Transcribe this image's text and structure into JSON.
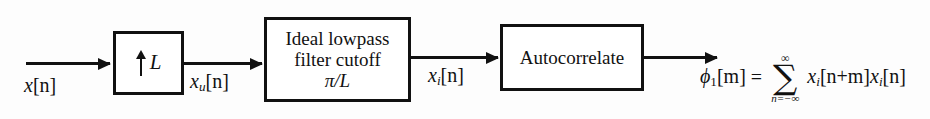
{
  "diagram": {
    "type": "signal-processing-block-diagram",
    "background_color": "#fdfdfd",
    "line_color": "#111111"
  },
  "blocks": {
    "upsampler": {
      "name": "upsampler",
      "arrow_symbol": "up-arrow",
      "factor_label": "L"
    },
    "lowpass": {
      "name": "ideal-lowpass-filter",
      "line1": "Ideal lowpass",
      "line2": "filter cutoff",
      "line3": "π/L"
    },
    "autocorrelate": {
      "name": "autocorrelate",
      "label": "Autocorrelate"
    }
  },
  "signals": {
    "input": {
      "base": "x",
      "subscript": "",
      "index": "[n]"
    },
    "upsampled": {
      "base": "x",
      "subscript": "u",
      "index": "[n]"
    },
    "interpolated": {
      "base": "x",
      "subscript": "i",
      "index": "[n]"
    }
  },
  "equation": {
    "lhs_base": "ϕ",
    "lhs_subscript": "1",
    "lhs_index": "[m]",
    "equals": "=",
    "sigma": "∑",
    "sigma_upper": "∞",
    "sigma_lower": "n=−∞",
    "term1_base": "x",
    "term1_subscript": "i",
    "term1_index": "[n+m]",
    "term2_base": "x",
    "term2_subscript": "i",
    "term2_index": "[n]"
  }
}
